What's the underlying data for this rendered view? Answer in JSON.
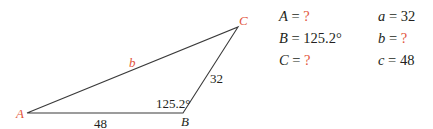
{
  "colors": {
    "line": "#3a3a3a",
    "text": "#231f20",
    "highlight": "#e2553b"
  },
  "triangle": {
    "vertices": {
      "A": {
        "label": "A",
        "x": 27,
        "y": 113
      },
      "B": {
        "label": "B",
        "x": 183,
        "y": 113
      },
      "C": {
        "label": "C",
        "x": 238,
        "y": 27
      }
    },
    "sides": {
      "b": {
        "label": "b",
        "from": "A",
        "to": "C"
      },
      "a": {
        "label": "32",
        "from": "B",
        "to": "C"
      },
      "c": {
        "label": "48",
        "from": "A",
        "to": "B"
      }
    },
    "angle_B_label": "125.2°"
  },
  "given": {
    "left": [
      {
        "var": "A",
        "eq": " = ",
        "value": "?",
        "unknown": true
      },
      {
        "var": "B",
        "eq": " = ",
        "value": "125.2°",
        "unknown": false
      },
      {
        "var": "C",
        "eq": " = ",
        "value": "?",
        "unknown": true
      }
    ],
    "right": [
      {
        "var": "a",
        "eq": " = ",
        "value": "32",
        "unknown": false
      },
      {
        "var": "b",
        "eq": " = ",
        "value": "?",
        "unknown": true
      },
      {
        "var": "c",
        "eq": " = ",
        "value": "48",
        "unknown": false
      }
    ]
  }
}
